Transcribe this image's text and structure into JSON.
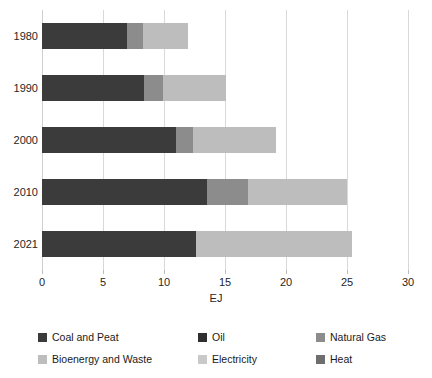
{
  "chart_data": {
    "type": "bar",
    "orientation": "horizontal",
    "stacked": true,
    "title": "",
    "subtitle": "",
    "xlabel": "EJ",
    "ylabel": "",
    "xlim": [
      0,
      30
    ],
    "xticks": [
      0,
      5,
      10,
      15,
      20,
      25,
      30
    ],
    "xticklabels": [
      "0",
      "5",
      "10",
      "15",
      "20",
      "25",
      "30"
    ],
    "categories": [
      "1980",
      "1990",
      "2000",
      "2010",
      "2021"
    ],
    "grid": true,
    "grid_axis": "x",
    "legend_position": "below",
    "series": [
      {
        "name": "Coal and Peat",
        "color": "#3b3b3b",
        "values": [
          7.0,
          8.4,
          11.0,
          13.5,
          12.6
        ]
      },
      {
        "name": "Oil",
        "color": "#2f2f2f",
        "values": [
          0.0,
          0.0,
          0.0,
          0.0,
          0.0
        ]
      },
      {
        "name": "Natural Gas",
        "color": "#8c8c8c",
        "values": [
          1.3,
          1.5,
          1.4,
          3.4,
          0.0
        ]
      },
      {
        "name": "Bioenergy and Waste",
        "color": "#bdbdbd",
        "values": [
          3.7,
          5.2,
          6.8,
          8.1,
          12.8
        ]
      },
      {
        "name": "Electricity",
        "color": "#c9c9c9",
        "values": [
          0.0,
          0.0,
          0.0,
          0.0,
          0.0
        ]
      },
      {
        "name": "Heat",
        "color": "#6e6e6e",
        "values": [
          0.0,
          0.0,
          0.0,
          0.0,
          0.0
        ]
      }
    ],
    "totals": [
      12.0,
      15.1,
      19.2,
      25.0,
      25.4
    ]
  },
  "legend": {
    "items": [
      {
        "label": "Coal and Peat",
        "color": "#3b3b3b"
      },
      {
        "label": "Oil",
        "color": "#2f2f2f"
      },
      {
        "label": "Natural Gas",
        "color": "#8c8c8c"
      },
      {
        "label": "Bioenergy and Waste",
        "color": "#bdbdbd"
      },
      {
        "label": "Electricity",
        "color": "#c9c9c9"
      },
      {
        "label": "Heat",
        "color": "#6e6e6e"
      }
    ]
  }
}
